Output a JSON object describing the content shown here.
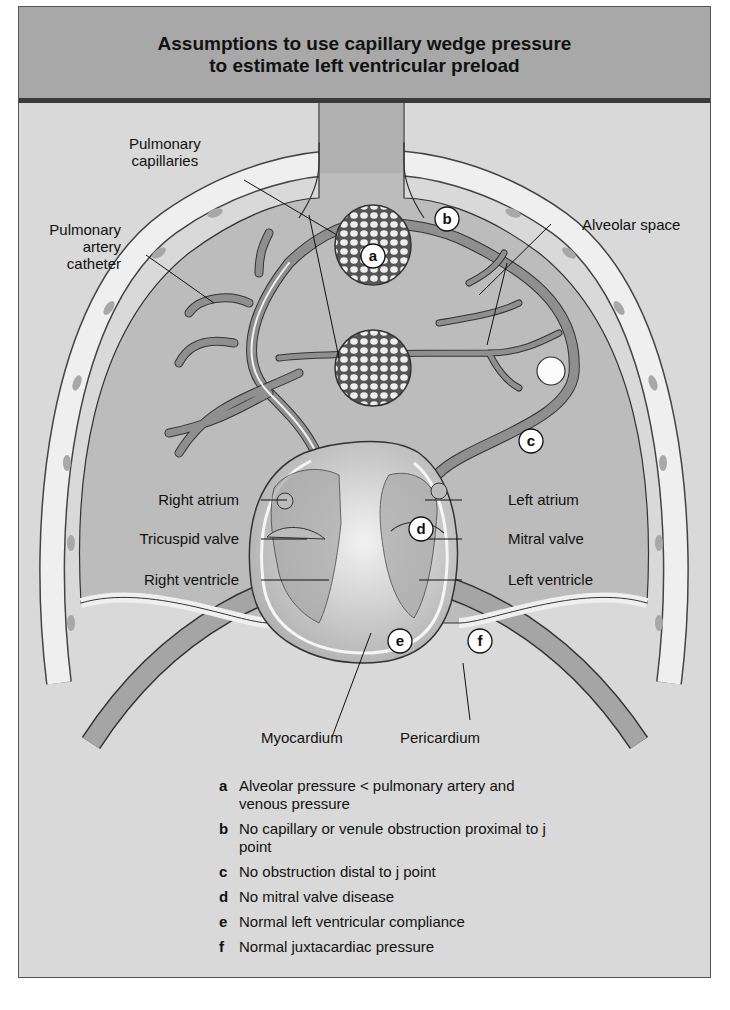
{
  "title": {
    "line1": "Assumptions to use capillary wedge pressure",
    "line2": "to estimate left ventricular preload"
  },
  "labels": {
    "pulmonary_capillaries": [
      "Pulmonary",
      "capillaries"
    ],
    "pulmonary_artery_catheter": [
      "Pulmonary",
      "artery",
      "catheter"
    ],
    "alveolar_space": "Alveolar space",
    "right_atrium": "Right atrium",
    "tricuspid_valve": "Tricuspid valve",
    "right_ventricle": "Right ventricle",
    "left_atrium": "Left atrium",
    "mitral_valve": "Mitral valve",
    "left_ventricle": "Left ventricle",
    "myocardium": "Myocardium",
    "pericardium": "Pericardium"
  },
  "markers": [
    "a",
    "b",
    "c",
    "d",
    "e",
    "f"
  ],
  "legend": [
    {
      "key": "a",
      "text": "Alveolar pressure < pulmonary artery and venous pressure"
    },
    {
      "key": "b",
      "text": "No capillary or venule obstruction proximal to j point"
    },
    {
      "key": "c",
      "text": "No obstruction distal to j point"
    },
    {
      "key": "d",
      "text": "No mitral valve disease"
    },
    {
      "key": "e",
      "text": "Normal left ventricular compliance"
    },
    {
      "key": "f",
      "text": "Normal juxtacardiac pressure"
    }
  ],
  "colors": {
    "header_bg": "#a8a8a8",
    "panel_bg": "#d9d9d9",
    "lung_fill": "#bdbdbd",
    "vessel": "#8f8f8f",
    "pleura": "#ececec"
  }
}
